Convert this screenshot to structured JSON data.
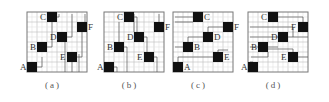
{
  "figure": {
    "grid": {
      "cols": 6,
      "rows": 6,
      "cell_px": 10,
      "line_color": "#bdbdbd",
      "border_color": "#777777",
      "block_color": "#111111",
      "arrow_color": "#555555"
    },
    "panels": [
      {
        "id": "a",
        "caption": "(a)",
        "origin_x": 27,
        "caption_x": 33,
        "blocks": [
          {
            "label": "C",
            "col": 2,
            "row": 0,
            "label_side": "left"
          },
          {
            "label": "F",
            "col": 5,
            "row": 1,
            "label_side": "right"
          },
          {
            "label": "D",
            "col": 3,
            "row": 2,
            "label_side": "left"
          },
          {
            "label": "B",
            "col": 1,
            "row": 3,
            "label_side": "left"
          },
          {
            "label": "E",
            "col": 4,
            "row": 4,
            "label_side": "left"
          },
          {
            "label": "A",
            "col": 0,
            "row": 5,
            "label_side": "left"
          }
        ],
        "routing": "vertical-up",
        "paths": [
          "M8 60 V55 H15 V45",
          "M17 40 V35 H25 V10",
          "M28 10 V5 H32 V2",
          "M38 30 V25 H45 V2",
          "M48 50 V45 H55 V20",
          "M58 20 V2",
          "M45 60 V50",
          "M38 60 V30",
          "M52 60 V42"
        ]
      },
      {
        "id": "b",
        "caption": "(b)",
        "origin_x": 104,
        "caption_x": 110,
        "blocks": [
          {
            "label": "C",
            "col": 2,
            "row": 0,
            "label_side": "left"
          },
          {
            "label": "F",
            "col": 5,
            "row": 1,
            "label_side": "right"
          },
          {
            "label": "D",
            "col": 3,
            "row": 2,
            "label_side": "left"
          },
          {
            "label": "B",
            "col": 1,
            "row": 3,
            "label_side": "left"
          },
          {
            "label": "E",
            "col": 4,
            "row": 4,
            "label_side": "left"
          },
          {
            "label": "A",
            "col": 0,
            "row": 5,
            "label_side": "left"
          }
        ],
        "routing": "vertical-down",
        "paths": [
          "M30 5 H33 V20",
          "M40 25 H43 V40",
          "M20 35 H23 V60",
          "M10 55 H13 V60",
          "M50 45 H53 V60",
          "M15 10 V30",
          "M55 2 V10",
          "M30 2 V20"
        ]
      },
      {
        "id": "c",
        "caption": "(c)",
        "origin_x": 173,
        "caption_x": 185,
        "blocks": [
          {
            "label": "C",
            "col": 2,
            "row": 0,
            "label_side": "right"
          },
          {
            "label": "F",
            "col": 5,
            "row": 1,
            "label_side": "right"
          },
          {
            "label": "D",
            "col": 3,
            "row": 2,
            "label_side": "right"
          },
          {
            "label": "B",
            "col": 1,
            "row": 3,
            "label_side": "right"
          },
          {
            "label": "E",
            "col": 4,
            "row": 4,
            "label_side": "right"
          },
          {
            "label": "A",
            "col": 0,
            "row": 5,
            "label_side": "right"
          }
        ],
        "routing": "horizontal-right",
        "paths": [
          "M2 5 H20",
          "M2 10 H20",
          "M2 35 H10",
          "M15 30 V25 H30",
          "M35 20 V15 H50",
          "M55 15 V12 H58 V10",
          "M5 50 V45 H40",
          "M45 40 V38 H55"
        ]
      },
      {
        "id": "d",
        "caption": "(d)",
        "origin_x": 248,
        "caption_x": 260,
        "blocks": [
          {
            "label": "C",
            "col": 2,
            "row": 0,
            "label_side": "left"
          },
          {
            "label": "F",
            "col": 5,
            "row": 1,
            "label_side": "left"
          },
          {
            "label": "D",
            "col": 3,
            "row": 2,
            "label_side": "left"
          },
          {
            "label": "B",
            "col": 1,
            "row": 3,
            "label_side": "left"
          },
          {
            "label": "E",
            "col": 4,
            "row": 4,
            "label_side": "left"
          },
          {
            "label": "A",
            "col": 0,
            "row": 5,
            "label_side": "left"
          }
        ],
        "routing": "horizontal-left",
        "paths": [
          "M55 10 V5 H30",
          "M45 25 V15 H2",
          "M40 25 H2",
          "M30 35 H2",
          "M20 40 V45 H3",
          "M45 45 V37 H20",
          "M60 45 H50",
          "M60 25 H40",
          "M5 50 H2"
        ]
      }
    ]
  }
}
